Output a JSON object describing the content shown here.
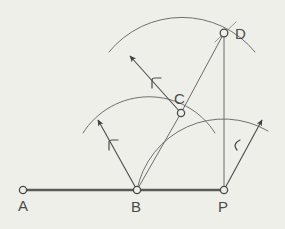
{
  "figure": {
    "background_color": "#efefea",
    "ink_color": "#5a5a5a",
    "line_color": "#6b6b6b",
    "label_color": "#4b4b4b",
    "points": [
      {
        "id": "A",
        "label": "A",
        "x": 23,
        "y": 190,
        "label_x": 18,
        "label_y": 210
      },
      {
        "id": "B",
        "label": "B",
        "x": 137,
        "y": 190,
        "label_x": 131,
        "label_y": 211
      },
      {
        "id": "P",
        "label": "P",
        "x": 224,
        "y": 190,
        "label_x": 218,
        "label_y": 211
      },
      {
        "id": "C",
        "label": "C",
        "x": 181,
        "y": 113,
        "label_x": 174,
        "label_y": 102
      },
      {
        "id": "D",
        "label": "D",
        "x": 224,
        "y": 33,
        "label_x": 236,
        "label_y": 38
      }
    ],
    "segments": [
      {
        "id": "baseline-A-P",
        "from": "A",
        "to": "P",
        "width": 2.2
      },
      {
        "id": "line-B-C",
        "from": "B",
        "to": "C",
        "width": 1.0
      },
      {
        "id": "line-C-D",
        "from": "C",
        "to": "D",
        "width": 1.0
      },
      {
        "id": "line-D-P",
        "from": "D",
        "to": "P",
        "width": 1.0
      }
    ],
    "arcs": [
      {
        "id": "arc-center-B",
        "center": "B",
        "radius": 78,
        "label": "r"
      },
      {
        "id": "arc-center-P",
        "center": "P",
        "radius": 88,
        "label": "r"
      },
      {
        "id": "arc-center-C",
        "center": "C",
        "radius": 94,
        "label": "r"
      }
    ],
    "radius_marks": [
      {
        "id": "radius-mark-B",
        "text": "r",
        "x": 113,
        "y": 146
      },
      {
        "id": "radius-mark-P",
        "text": "r",
        "x": 234,
        "y": 146
      },
      {
        "id": "radius-mark-C",
        "text": "r",
        "x": 157,
        "y": 83
      }
    ],
    "arrows": [
      {
        "id": "radius-arrow-B",
        "from": "B",
        "tip_x": 96,
        "tip_y": 118
      },
      {
        "id": "radius-arrow-P",
        "from": "P",
        "tip_x": 264,
        "tip_y": 118
      },
      {
        "id": "radius-arrow-C",
        "from": "C",
        "tip_x": 128,
        "tip_y": 54
      }
    ]
  }
}
